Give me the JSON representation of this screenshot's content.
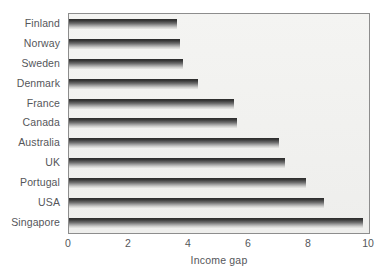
{
  "chart_data": {
    "type": "bar",
    "orientation": "horizontal",
    "title": "",
    "subtitle": "",
    "xlabel": "Income gap",
    "ylabel": "",
    "categories": [
      "Finland",
      "Norway",
      "Sweden",
      "Denmark",
      "France",
      "Canada",
      "Australia",
      "UK",
      "Portugal",
      "USA",
      "Singapore"
    ],
    "values": [
      3.6,
      3.7,
      3.8,
      4.3,
      5.5,
      5.6,
      7.0,
      7.2,
      7.9,
      8.5,
      9.8
    ],
    "series": [
      {
        "name": "Income gap",
        "values": [
          3.6,
          3.7,
          3.8,
          4.3,
          5.5,
          5.6,
          7.0,
          7.2,
          7.9,
          8.5,
          9.8
        ]
      }
    ],
    "xlim": [
      0,
      10
    ],
    "xticks": [
      0,
      2,
      4,
      6,
      8,
      10
    ],
    "xtick_labels": [
      "0",
      "2",
      "4",
      "6",
      "8",
      "10"
    ],
    "grid": false,
    "legend": false,
    "legend_position": "none",
    "colors": {
      "bar_dark": "#2b2b2b",
      "bar_light": "#e8e8e6",
      "plot_background": "#f1f1ef",
      "frame": "#8d8d8d",
      "text": "#55565a",
      "page_background": "#ffffff"
    }
  }
}
